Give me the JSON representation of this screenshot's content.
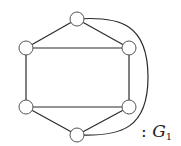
{
  "diagram": {
    "type": "graph",
    "label": {
      "prefix": ":",
      "name": "G",
      "subscript": "1"
    },
    "nodes": [
      {
        "id": "top",
        "x": 77,
        "y": 19
      },
      {
        "id": "upper-left",
        "x": 26,
        "y": 48
      },
      {
        "id": "upper-right",
        "x": 129,
        "y": 48
      },
      {
        "id": "lower-left",
        "x": 26,
        "y": 107
      },
      {
        "id": "lower-right",
        "x": 129,
        "y": 107
      },
      {
        "id": "bottom",
        "x": 77,
        "y": 135
      }
    ],
    "edges": [
      [
        "top",
        "upper-left"
      ],
      [
        "top",
        "upper-right"
      ],
      [
        "upper-left",
        "upper-right"
      ],
      [
        "upper-left",
        "lower-left"
      ],
      [
        "upper-right",
        "lower-right"
      ],
      [
        "lower-left",
        "lower-right"
      ],
      [
        "lower-left",
        "bottom"
      ],
      [
        "lower-right",
        "bottom"
      ],
      [
        "top",
        "bottom",
        "curved-right"
      ]
    ],
    "colors": {
      "edge": "#2b2b2b",
      "node_stroke": "#555555",
      "node_fill": "#ffffff"
    }
  }
}
